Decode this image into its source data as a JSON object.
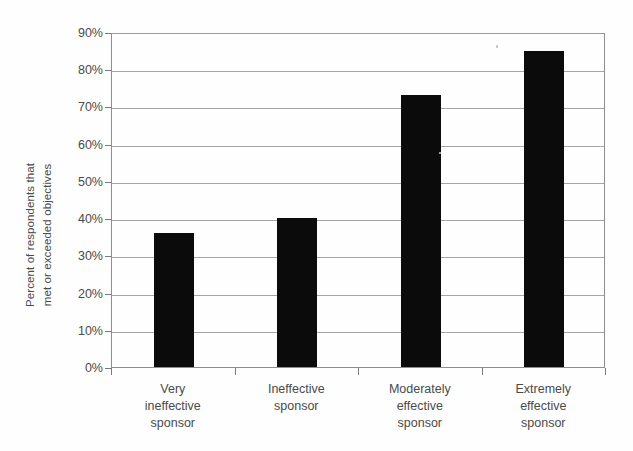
{
  "chart_data": {
    "type": "bar",
    "title": "",
    "subtitle": "",
    "xlabel": "",
    "ylabel": "Percent of respondents that met or exceeded objectives",
    "ylabel_lines": [
      "Percent of respondents that",
      "met or exceeded objectives"
    ],
    "categories": [
      "Very ineffective sponsor",
      "Ineffective sponsor",
      "Moderately effective sponsor",
      "Extremely effective sponsor"
    ],
    "category_lines": [
      [
        "Very",
        "ineffective",
        "sponsor"
      ],
      [
        "Ineffective",
        "sponsor"
      ],
      [
        "Moderately",
        "effective",
        "sponsor"
      ],
      [
        "Extremely",
        "effective",
        "sponsor"
      ]
    ],
    "values": [
      36,
      40,
      73,
      85
    ],
    "value_labels": [
      "36%",
      "40%",
      "73%",
      "85%"
    ],
    "ylim": [
      0,
      90
    ],
    "ytick_values": [
      0,
      10,
      20,
      30,
      40,
      50,
      60,
      70,
      80,
      90
    ],
    "ytick_labels": [
      "0%",
      "10%",
      "20%",
      "30%",
      "40%",
      "50%",
      "60%",
      "70%",
      "80%",
      "90%"
    ],
    "grid": true,
    "grid_axis": "y",
    "legend": false,
    "legend_position": "none",
    "bar_color": "#0b0b0b",
    "grid_color": "#a5a5a5",
    "axis_color": "#8e8e8e",
    "text_color": "#4a4a4a",
    "background_color": "#fefefe"
  }
}
